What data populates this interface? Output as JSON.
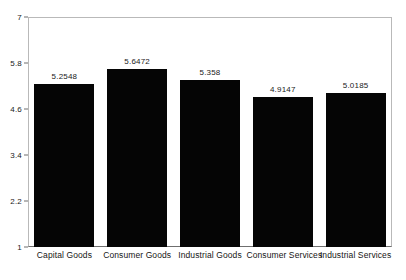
{
  "chart_data": {
    "type": "bar",
    "title": "",
    "subtitle": "",
    "xlabel": "",
    "ylabel": "",
    "categories": [
      "Capital Goods",
      "Consumer Goods",
      "Industrial Goods",
      "Consumer Services",
      "Industrial Services"
    ],
    "values": [
      5.2548,
      5.6472,
      5.358,
      4.9147,
      5.0185
    ],
    "value_labels": [
      "5.2548",
      "5.6472",
      "5.358",
      "4.9147",
      "5.0185"
    ],
    "ylim": [
      1,
      7
    ],
    "yticks": [
      1,
      2.2,
      3.4,
      4.6,
      5.8,
      7
    ],
    "ytick_labels": [
      "1",
      "2.2",
      "3.4",
      "4.6",
      "5.8",
      "7"
    ],
    "grid": false,
    "legend": null,
    "bar_color": "#050505",
    "frame_color": "#b9b9b9",
    "axis_color": "#6f6f6f",
    "background": "#ffffff",
    "text_color": "#1a1a1a"
  }
}
